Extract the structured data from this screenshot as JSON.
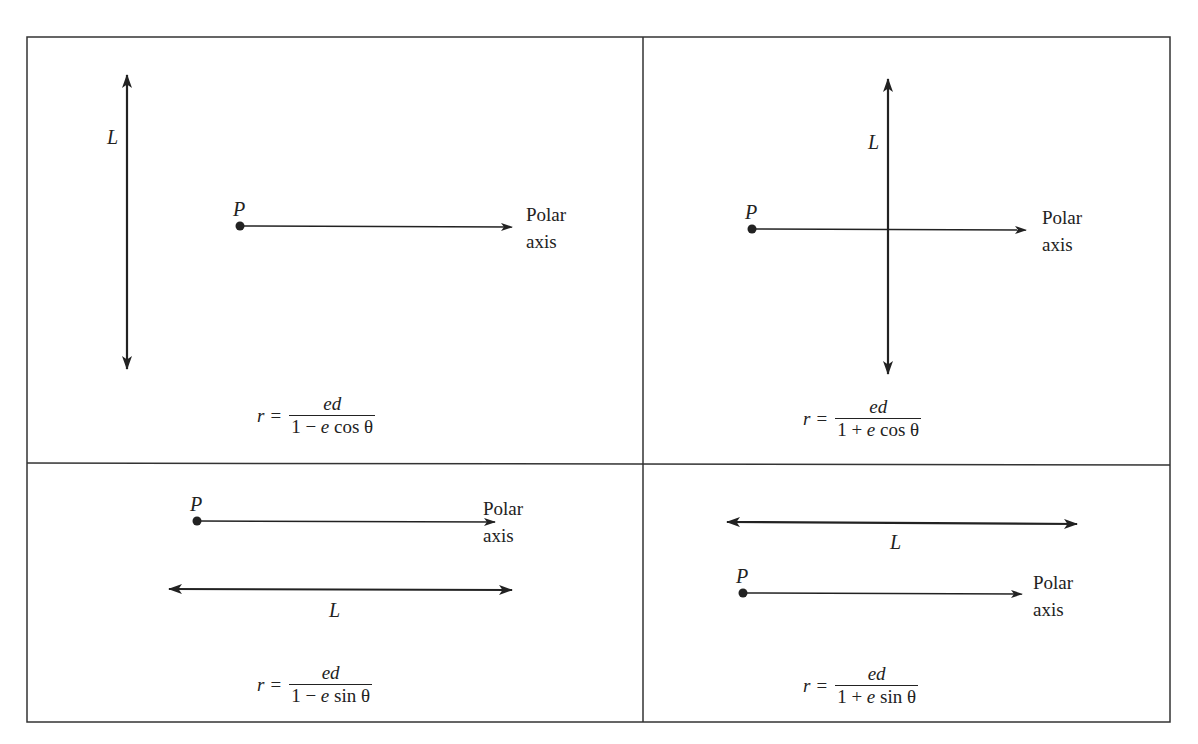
{
  "figure": {
    "colors": {
      "line": "#222222",
      "background": "#ffffff"
    },
    "panels": [
      {
        "id": "top-left",
        "directrix_orientation": "vertical",
        "directrix_position": "left of pole",
        "directrix_label": "L",
        "pole_label": "P",
        "axis_label_line1": "Polar",
        "axis_label_line2": "axis",
        "formula": {
          "lhs": "r",
          "eq": "=",
          "numerator": "ed",
          "den_const": "1",
          "den_op": "−",
          "den_e": "e",
          "den_trig": "cos θ"
        }
      },
      {
        "id": "top-right",
        "directrix_orientation": "vertical",
        "directrix_position": "right of pole",
        "directrix_label": "L",
        "pole_label": "P",
        "axis_label_line1": "Polar",
        "axis_label_line2": "axis",
        "formula": {
          "lhs": "r",
          "eq": "=",
          "numerator": "ed",
          "den_const": "1",
          "den_op": "+",
          "den_e": "e",
          "den_trig": "cos θ"
        }
      },
      {
        "id": "bottom-left",
        "directrix_orientation": "horizontal",
        "directrix_position": "below pole",
        "directrix_label": "L",
        "pole_label": "P",
        "axis_label_line1": "Polar",
        "axis_label_line2": "axis",
        "formula": {
          "lhs": "r",
          "eq": "=",
          "numerator": "ed",
          "den_const": "1",
          "den_op": "−",
          "den_e": "e",
          "den_trig": "sin θ"
        }
      },
      {
        "id": "bottom-right",
        "directrix_orientation": "horizontal",
        "directrix_position": "above pole",
        "directrix_label": "L",
        "pole_label": "P",
        "axis_label_line1": "Polar",
        "axis_label_line2": "axis",
        "formula": {
          "lhs": "r",
          "eq": "=",
          "numerator": "ed",
          "den_const": "1",
          "den_op": "+",
          "den_e": "e",
          "den_trig": "sin θ"
        }
      }
    ]
  }
}
